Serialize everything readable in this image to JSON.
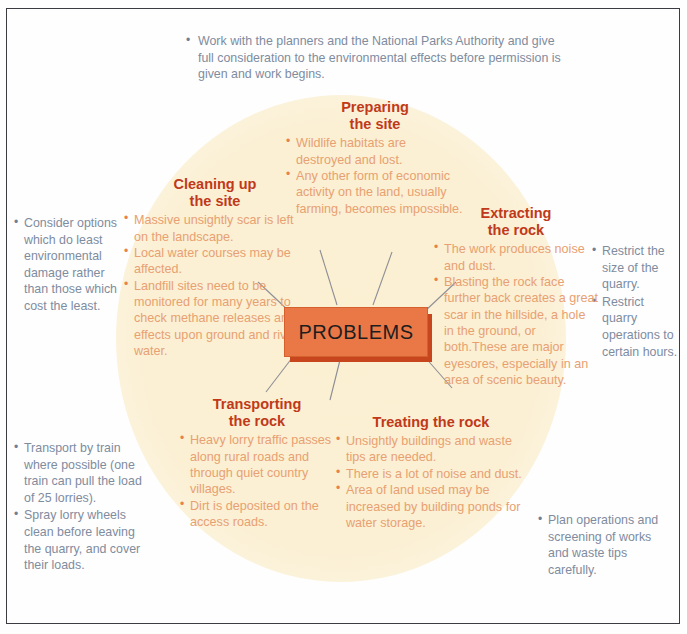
{
  "diagram": {
    "center_label": "PROBLEMS",
    "colors": {
      "heading": "#c0391a",
      "body_orange": "#e8a072",
      "note_blue": "#7e8c9e",
      "center_box": "#ea7847",
      "center_box_shadow": "#c8461d",
      "circle_fill": "#fbf0d2",
      "frame": "#3b3b42"
    },
    "sections": [
      {
        "id": "preparing",
        "title_line1": "Preparing",
        "title_line2": "the site",
        "bullets": [
          "Wildlife habitats are destroyed and lost.",
          "Any other form of economic activity on the land, usually farming, becomes impossible."
        ]
      },
      {
        "id": "cleaning",
        "title_line1": "Cleaning up",
        "title_line2": "the site",
        "bullets": [
          "Massive unsightly scar is left on the landscape.",
          "Local water courses may be affected.",
          "Landfill sites need to be monitored for many years to check methane releases and effects upon ground and river water."
        ]
      },
      {
        "id": "extracting",
        "title_line1": "Extracting",
        "title_line2": "the rock",
        "bullets": [
          "The work produces noise and dust.",
          "Blasting the rock face further back creates a great scar in the hillside, a hole in the ground, or both.These are major eyesores, especially in an area of scenic beauty."
        ]
      },
      {
        "id": "transporting",
        "title_line1": "Transporting",
        "title_line2": "the rock",
        "bullets": [
          "Heavy lorry traffic passes along rural roads and through quiet country villages.",
          "Dirt is deposited on the access roads."
        ]
      },
      {
        "id": "treating",
        "title_line1": "Treating the rock",
        "title_line2": "",
        "bullets": [
          "Unsightly buildings and waste tips are needed.",
          "There is a lot of noise and dust.",
          "Area of land used may be increased by building ponds for water storage."
        ]
      }
    ],
    "notes": {
      "top": [
        "Work with the planners and the National Parks Authority and give full consideration to the environmental effects before permission is given and work begins."
      ],
      "left_upper": [
        "Consider options which do least environmental damage rather than those which cost the least."
      ],
      "left_lower": [
        "Transport by train where possible (one train can pull the load of 25 lorries).",
        "Spray lorry wheels clean before leaving the quarry, and cover their loads."
      ],
      "right_upper": [
        "Restrict the size of the quarry.",
        "Restrict quarry operations to certain hours."
      ],
      "right_lower": [
        "Plan operations and screening of works and waste tips carefully."
      ]
    }
  }
}
